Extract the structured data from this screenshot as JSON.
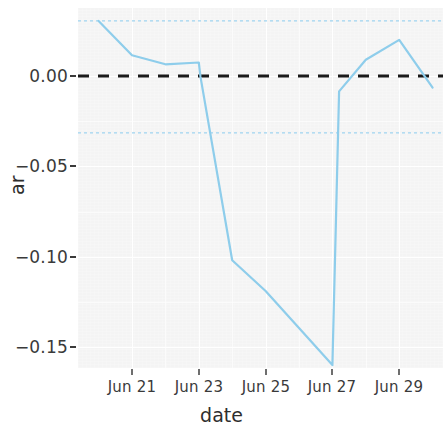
{
  "chart_data": {
    "type": "line",
    "title": "",
    "subtitle": "",
    "xlabel": "date",
    "ylabel": "ar",
    "grid": true,
    "legend": "none",
    "xlim": [
      "Jun 20",
      "Jun 30"
    ],
    "ylim": [
      -0.168,
      0.035
    ],
    "x_tick_labels": [
      "Jun 21",
      "Jun 23",
      "Jun 25",
      "Jun 27",
      "Jun 29"
    ],
    "x_tick_values": [
      "2023-06-21",
      "2023-06-23",
      "2023-06-25",
      "2023-06-27",
      "2023-06-29"
    ],
    "y_tick_labels": [
      "0.00",
      "−0.05",
      "−0.10",
      "−0.15"
    ],
    "y_tick_values": [
      0.0,
      -0.05,
      -0.1,
      -0.15
    ],
    "series": [
      {
        "name": "ar",
        "color": "#8ecdeb",
        "x": [
          "Jun 20",
          "Jun 21",
          "Jun 22",
          "Jun 23",
          "Jun 23.05",
          "Jun 24",
          "Jun 25",
          "Jun 26",
          "Jun 27",
          "Jun 27.2",
          "Jun 28",
          "Jun 29",
          "Jun 30"
        ],
        "values": [
          0.0305,
          0.0115,
          0.0065,
          0.0075,
          -0.0005,
          -0.102,
          -0.119,
          -0.1395,
          -0.16,
          -0.0085,
          0.009,
          0.02,
          -0.0065
        ]
      }
    ],
    "reference_lines": [
      {
        "name": "zero-line",
        "value": 0.0,
        "color": "#1a1a1a",
        "style": "dashed",
        "width": 3
      },
      {
        "name": "upper-threshold",
        "value": 0.0305,
        "color": "#9fd4ef",
        "style": "dotted",
        "width": 1
      },
      {
        "name": "lower-threshold",
        "value": -0.0315,
        "color": "#9fd4ef",
        "style": "dotted",
        "width": 1
      }
    ],
    "panel_background": "#f4f4f4",
    "gridline_color": "#ffffff",
    "figure_background": "#ffffff"
  },
  "axes": {
    "y_title": "ar",
    "x_title": "date"
  }
}
